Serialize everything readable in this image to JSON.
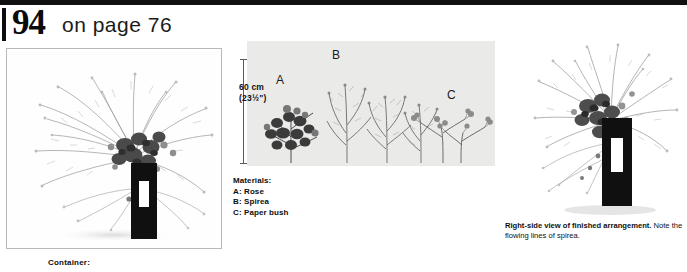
{
  "header": {
    "number": "94",
    "text": "on page 76"
  },
  "scale": {
    "metric": "60 cm",
    "imperial": "(23½\")"
  },
  "labels": {
    "a": "A",
    "b": "B",
    "c": "C"
  },
  "materials": {
    "title": "Materials:",
    "items": [
      {
        "key": "A:",
        "name": "Rose"
      },
      {
        "key": "B:",
        "name": "Spirea"
      },
      {
        "key": "C:",
        "name": "Paper bush"
      }
    ]
  },
  "right_caption": {
    "bold": "Right-side view of finished arrangement.",
    "rest": " Note the flowing lines of spirea."
  },
  "container_label": "Container:",
  "colors": {
    "ink": "#101010",
    "frame_border": "#b9b9b9",
    "panel_bg": "#e9e9e7",
    "vase": "#101010"
  }
}
